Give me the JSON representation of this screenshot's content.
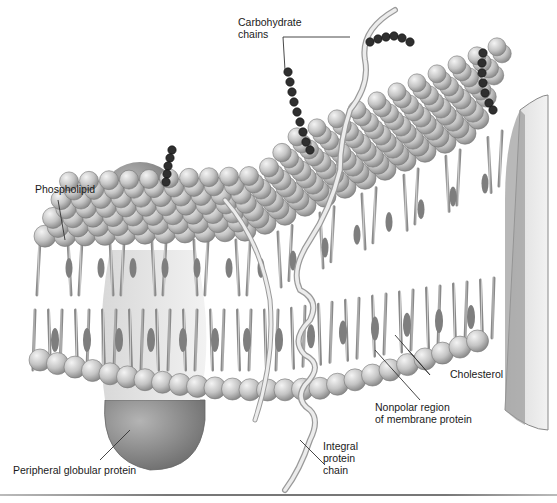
{
  "figure": {
    "colors": {
      "background": "#ffffff",
      "phospholipid_head": "#c9c9c9",
      "phospholipid_tail": "#a8a8a8",
      "protein": "#8c8c8c",
      "carbohydrate": "#2e2e2e",
      "integral_chain": "#e6e6e6",
      "leader_line": "#333333"
    }
  },
  "labels": {
    "carbohydrate": {
      "lines": [
        "Carbohydrate",
        "chains"
      ]
    },
    "phospholipid": {
      "lines": [
        "Phospholipid"
      ]
    },
    "cholesterol": {
      "lines": [
        "Cholesterol"
      ]
    },
    "nonpolar": {
      "lines": [
        "Nonpolar region",
        "of membrane protein"
      ]
    },
    "integral": {
      "lines": [
        "Integral",
        "protein",
        "chain"
      ]
    },
    "peripheral": {
      "lines": [
        "Peripheral globular protein"
      ]
    }
  }
}
